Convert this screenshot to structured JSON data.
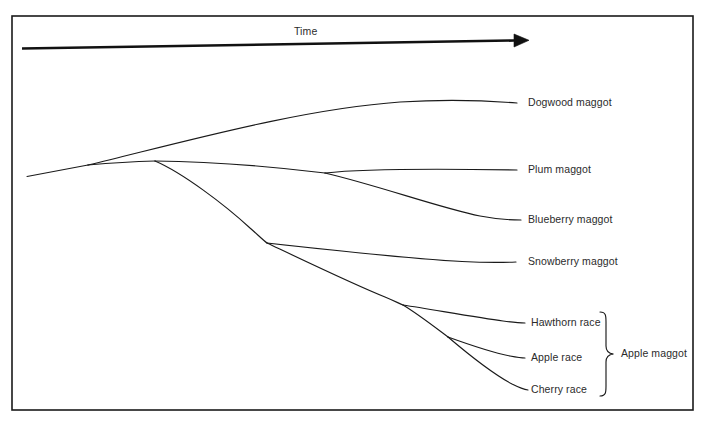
{
  "figure": {
    "kind": "phylogenetic-tree-diagram",
    "axis": {
      "label": "Time",
      "label_x": 294,
      "label_y": 27,
      "arrow_start_x": 22,
      "arrow_start_y": 48,
      "arrow_end_x": 527,
      "arrow_end_y": 40
    },
    "frame": {
      "x": 12,
      "y": 16,
      "width": 681,
      "height": 394,
      "stroke": "#1a1a1a",
      "stroke_width": 1.6
    },
    "line_color": "#1a1a1a",
    "text_color": "#2b2b2b",
    "background": "#ffffff"
  },
  "taxa": [
    {
      "id": "dogwood",
      "label": "Dogwood maggot",
      "tip_x": 517,
      "tip_y": 103,
      "label_x": 528,
      "label_y": 98
    },
    {
      "id": "plum",
      "label": "Plum maggot",
      "tip_x": 517,
      "tip_y": 170,
      "label_x": 528,
      "label_y": 165
    },
    {
      "id": "blueberry",
      "label": "Blueberry maggot",
      "tip_x": 521,
      "tip_y": 220,
      "label_x": 528,
      "label_y": 215
    },
    {
      "id": "snowberry",
      "label": "Snowberry maggot",
      "tip_x": 516,
      "tip_y": 262,
      "label_x": 528,
      "label_y": 257
    },
    {
      "id": "hawthorn",
      "label": "Hawthorn race",
      "tip_x": 525,
      "tip_y": 323,
      "label_x": 531,
      "label_y": 318
    },
    {
      "id": "apple",
      "label": "Apple race",
      "tip_x": 525,
      "tip_y": 358,
      "label_x": 531,
      "label_y": 353
    },
    {
      "id": "cherry",
      "label": "Cherry race",
      "tip_x": 528,
      "tip_y": 390,
      "label_x": 531,
      "label_y": 385
    }
  ],
  "group_bracket": {
    "label": "Apple maggot",
    "label_x": 621,
    "label_y": 347,
    "top_y": 312,
    "bottom_y": 396,
    "x": 606,
    "tip_x": 614,
    "mid_y": 354
  },
  "nodes": [
    {
      "id": "root",
      "x": 27,
      "y": 176
    },
    {
      "id": "split-dogwood",
      "x": 88,
      "y": 165
    },
    {
      "id": "split-main",
      "x": 155,
      "y": 161
    },
    {
      "id": "split-plum",
      "x": 325,
      "y": 173
    },
    {
      "id": "split-snow",
      "x": 267,
      "y": 243
    },
    {
      "id": "split-hawthorn",
      "x": 403,
      "y": 305
    },
    {
      "id": "split-cherry",
      "x": 448,
      "y": 337
    }
  ],
  "branches": [
    {
      "id": "branch-root-stem",
      "from": "root",
      "to": "split-dogwood"
    },
    {
      "id": "branch-to-dogwood",
      "from": "split-dogwood",
      "to": "dogwood"
    },
    {
      "id": "branch-to-main",
      "from": "split-dogwood",
      "to": "split-main"
    },
    {
      "id": "branch-to-plumnode",
      "from": "split-main",
      "to": "split-plum"
    },
    {
      "id": "branch-to-plum",
      "from": "split-plum",
      "to": "plum"
    },
    {
      "id": "branch-to-blueberry",
      "from": "split-plum",
      "to": "blueberry"
    },
    {
      "id": "branch-to-snownode",
      "from": "split-main",
      "to": "split-snow"
    },
    {
      "id": "branch-to-snowberry",
      "from": "split-snow",
      "to": "snowberry"
    },
    {
      "id": "branch-to-hawnode",
      "from": "split-snow",
      "to": "split-hawthorn"
    },
    {
      "id": "branch-to-hawthorn",
      "from": "split-hawthorn",
      "to": "hawthorn"
    },
    {
      "id": "branch-to-cherrynode",
      "from": "split-hawthorn",
      "to": "split-cherry"
    },
    {
      "id": "branch-to-apple",
      "from": "split-cherry",
      "to": "apple"
    },
    {
      "id": "branch-to-cherry",
      "from": "split-cherry",
      "to": "cherry"
    }
  ]
}
